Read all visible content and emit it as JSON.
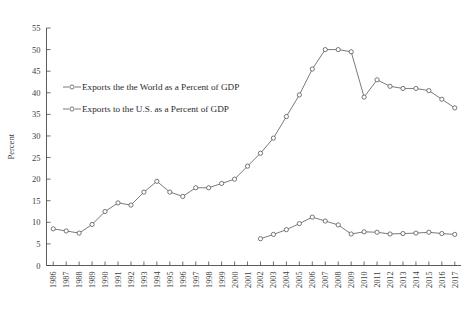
{
  "chart_data": {
    "type": "line",
    "title": "",
    "xlabel": "",
    "ylabel": "Percent",
    "ylim": [
      0,
      55
    ],
    "ytick_step": 5,
    "grid": false,
    "legend_position": "upper-left-inside",
    "yticks": [
      "0",
      "5",
      "10",
      "15",
      "20",
      "25",
      "30",
      "35",
      "40",
      "45",
      "50",
      "55"
    ],
    "categories": [
      "1986",
      "1987",
      "1988",
      "1989",
      "1990",
      "1991",
      "1992",
      "1993",
      "1994",
      "1995",
      "1996",
      "1997",
      "1998",
      "1999",
      "2000",
      "2001",
      "2002",
      "2003",
      "2004",
      "2005",
      "2006",
      "2007",
      "2008",
      "2009",
      "2010",
      "2011",
      "2012",
      "2013",
      "2014",
      "2015",
      "2016",
      "2017"
    ],
    "series": [
      {
        "name": "Exports the the World as a Percent of GDP",
        "marker": "circle-open",
        "color": "#6b6b70",
        "values": [
          8.5,
          8.0,
          7.5,
          9.5,
          12.5,
          14.5,
          14.0,
          17.0,
          19.5,
          17.0,
          16.0,
          18.0,
          18.0,
          19.0,
          20.0,
          23.0,
          26.0,
          29.5,
          34.5,
          39.5,
          45.5,
          50.0,
          50.0,
          49.5,
          39.0,
          43.0,
          41.5,
          41.0,
          41.0,
          40.5,
          38.5,
          36.5
        ]
      },
      {
        "name": "Exports to the U.S. as a Percent of GDP",
        "marker": "circle-open",
        "color": "#6b6b70",
        "values": [
          null,
          null,
          null,
          null,
          null,
          null,
          null,
          null,
          null,
          null,
          null,
          null,
          null,
          null,
          null,
          null,
          6.2,
          7.2,
          8.3,
          9.7,
          11.2,
          10.3,
          9.4,
          7.3,
          7.8,
          7.7,
          7.3,
          7.4,
          7.5,
          7.7,
          7.4,
          7.2
        ]
      }
    ],
    "legend": [
      {
        "label": "Exports the the World as a Percent of GDP",
        "marker": "circle-open"
      },
      {
        "label": "Exports to the U.S. as a Percent of GDP",
        "marker": "circle-open"
      }
    ]
  }
}
